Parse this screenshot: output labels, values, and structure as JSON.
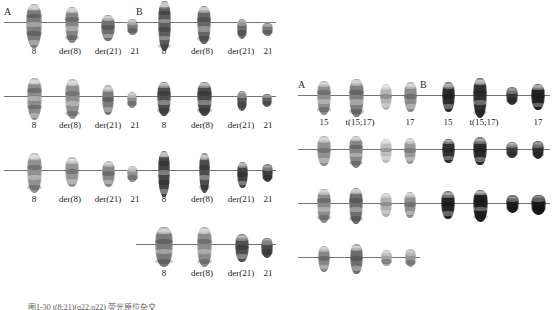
{
  "figure": {
    "background_color": "#ffffff",
    "line_color": "#5b5b5b",
    "caption_text": "图1-30  t(8;21)(q22;q22)  荧光原位杂交"
  },
  "left_panel": {
    "name": "t(8;21) panel",
    "column_a": {
      "letter": "A",
      "rows": [
        {
          "labels": [
            "8",
            "der(8)",
            "der(21)",
            "21"
          ],
          "chromosomes": [
            {
              "name": "chr-8",
              "width": 16,
              "height": 44,
              "tone": "#7b7b7b",
              "offset": 0
            },
            {
              "name": "chr-der8",
              "width": 14,
              "height": 36,
              "tone": "#858585",
              "offset": 0
            },
            {
              "name": "chr-der21",
              "width": 14,
              "height": 26,
              "tone": "#6f6f6f",
              "offset": 4
            },
            {
              "name": "chr-21",
              "width": 11,
              "height": 16,
              "tone": "#7d7d7d",
              "offset": 4
            }
          ]
        },
        {
          "labels": [
            "8",
            "der(8)",
            "der(21)",
            "21"
          ],
          "chromosomes": [
            {
              "name": "chr-8",
              "width": 15,
              "height": 42,
              "tone": "#8a8a8a",
              "offset": 0
            },
            {
              "name": "chr-der8",
              "width": 15,
              "height": 40,
              "tone": "#8f8f8f",
              "offset": 0
            },
            {
              "name": "chr-der21",
              "width": 12,
              "height": 30,
              "tone": "#7a7a7a",
              "offset": 2
            },
            {
              "name": "chr-21",
              "width": 10,
              "height": 16,
              "tone": "#8c8c8c",
              "offset": 3
            }
          ]
        },
        {
          "labels": [
            "8",
            "der(8)",
            "der(21)",
            "21"
          ],
          "chromosomes": [
            {
              "name": "chr-8",
              "width": 15,
              "height": 40,
              "tone": "#909090",
              "offset": 0
            },
            {
              "name": "chr-der8",
              "width": 14,
              "height": 30,
              "tone": "#959595",
              "offset": 0
            },
            {
              "name": "chr-der21",
              "width": 13,
              "height": 26,
              "tone": "#888888",
              "offset": 2
            },
            {
              "name": "chr-21",
              "width": 11,
              "height": 16,
              "tone": "#919191",
              "offset": 3
            }
          ]
        }
      ]
    },
    "column_b": {
      "letter": "B",
      "rows": [
        {
          "labels": [
            "8",
            "der(8)",
            "der(21)",
            "21"
          ],
          "chromosomes": [
            {
              "name": "chr-8",
              "width": 13,
              "height": 50,
              "tone": "#5c5c5c",
              "offset": 0
            },
            {
              "name": "chr-der8",
              "width": 14,
              "height": 38,
              "tone": "#656565",
              "offset": 0
            },
            {
              "name": "chr-der21",
              "width": 10,
              "height": 20,
              "tone": "#6b6b6b",
              "offset": 5
            },
            {
              "name": "chr-21",
              "width": 11,
              "height": 13,
              "tone": "#787878",
              "offset": 6
            }
          ]
        },
        {
          "labels": [
            "8",
            "der(8)",
            "der(21)",
            "21"
          ],
          "chromosomes": [
            {
              "name": "chr-8",
              "width": 14,
              "height": 34,
              "tone": "#4f4f4f",
              "offset": 0
            },
            {
              "name": "chr-der8",
              "width": 15,
              "height": 34,
              "tone": "#4a4a4a",
              "offset": 0
            },
            {
              "name": "chr-der21",
              "width": 10,
              "height": 20,
              "tone": "#585858",
              "offset": 3
            },
            {
              "name": "chr-21",
              "width": 10,
              "height": 13,
              "tone": "#5f5f5f",
              "offset": 3
            }
          ]
        },
        {
          "labels": [
            "8",
            "der(8)",
            "der(21)",
            "21"
          ],
          "chromosomes": [
            {
              "name": "chr-8",
              "width": 12,
              "height": 46,
              "tone": "#454545",
              "offset": 0
            },
            {
              "name": "chr-der8",
              "width": 11,
              "height": 40,
              "tone": "#4d4d4d",
              "offset": 0
            },
            {
              "name": "chr-der21",
              "width": 11,
              "height": 26,
              "tone": "#434343",
              "offset": 3
            },
            {
              "name": "chr-21",
              "width": 11,
              "height": 18,
              "tone": "#3f3f3f",
              "offset": 2
            }
          ]
        },
        {
          "labels": [
            "8",
            "der(8)",
            "der(21)",
            "21"
          ],
          "chromosomes": [
            {
              "name": "chr-8",
              "width": 18,
              "height": 40,
              "tone": "#7a7a7a",
              "offset": 0
            },
            {
              "name": "chr-der8",
              "width": 15,
              "height": 40,
              "tone": "#8a8a8a",
              "offset": 0
            },
            {
              "name": "chr-der21",
              "width": 14,
              "height": 28,
              "tone": "#4e4e4e",
              "offset": 2
            },
            {
              "name": "chr-21",
              "width": 12,
              "height": 20,
              "tone": "#4b4b4b",
              "offset": 2
            }
          ]
        }
      ]
    }
  },
  "right_panel": {
    "name": "t(15;17) panel",
    "column_a": {
      "letter": "A",
      "rows": [
        {
          "labels": [
            "15",
            "t(15;17)",
            "17"
          ],
          "chromosomes": [
            {
              "name": "chr-15",
              "width": 14,
              "height": 34,
              "tone": "#8d8d8d",
              "offset": 0
            },
            {
              "name": "chr-t1517",
              "width": 15,
              "height": 38,
              "tone": "#7e7e7e",
              "offset": 0
            },
            {
              "name": "chr-t1517-b",
              "width": 12,
              "height": 26,
              "tone": "#b4b4b4",
              "offset": 0
            },
            {
              "name": "chr-17",
              "width": 13,
              "height": 30,
              "tone": "#8b8b8b",
              "offset": 0
            }
          ]
        },
        {
          "labels": [],
          "chromosomes": [
            {
              "name": "chr-15",
              "width": 14,
              "height": 30,
              "tone": "#909090",
              "offset": 0
            },
            {
              "name": "chr-t1517",
              "width": 14,
              "height": 32,
              "tone": "#848484",
              "offset": 0
            },
            {
              "name": "chr-t1517-b",
              "width": 12,
              "height": 24,
              "tone": "#bdbdbd",
              "offset": 0
            },
            {
              "name": "chr-17",
              "width": 12,
              "height": 26,
              "tone": "#9a9a9a",
              "offset": 0
            }
          ]
        },
        {
          "labels": [],
          "chromosomes": [
            {
              "name": "chr-15",
              "width": 14,
              "height": 34,
              "tone": "#8a8a8a",
              "offset": 0
            },
            {
              "name": "chr-t1517",
              "width": 14,
              "height": 36,
              "tone": "#6e6e6e",
              "offset": 0
            },
            {
              "name": "chr-t1517-b",
              "width": 12,
              "height": 24,
              "tone": "#b0b0b0",
              "offset": 0
            },
            {
              "name": "chr-17",
              "width": 12,
              "height": 26,
              "tone": "#8f8f8f",
              "offset": 0
            }
          ]
        },
        {
          "labels": [],
          "chromosomes": [
            {
              "name": "chr-15",
              "width": 12,
              "height": 26,
              "tone": "#878787",
              "offset": 0
            },
            {
              "name": "chr-t1517",
              "width": 13,
              "height": 30,
              "tone": "#6d6d6d",
              "offset": 0
            },
            {
              "name": "chr-t1517-b",
              "width": 11,
              "height": 16,
              "tone": "#a3a3a3",
              "offset": 0
            },
            {
              "name": "chr-17",
              "width": 11,
              "height": 18,
              "tone": "#959595",
              "offset": 0
            }
          ]
        }
      ]
    },
    "column_b": {
      "letter": "B",
      "rows": [
        {
          "labels": [
            "15",
            "t(15;17)",
            "17"
          ],
          "chromosomes": [
            {
              "name": "chr-15",
              "width": 13,
              "height": 30,
              "tone": "#2b2b2b",
              "offset": 0
            },
            {
              "name": "chr-t1517",
              "width": 14,
              "height": 40,
              "tone": "#2f2f2f",
              "offset": 0
            },
            {
              "name": "chr-t1517-b",
              "width": 12,
              "height": 18,
              "tone": "#353535",
              "offset": 0
            },
            {
              "name": "chr-17",
              "width": 14,
              "height": 26,
              "tone": "#222222",
              "offset": 0
            }
          ]
        },
        {
          "labels": [],
          "chromosomes": [
            {
              "name": "chr-15",
              "width": 13,
              "height": 24,
              "tone": "#303030",
              "offset": 0
            },
            {
              "name": "chr-t1517",
              "width": 14,
              "height": 28,
              "tone": "#2a2a2a",
              "offset": 0
            },
            {
              "name": "chr-t1517-b",
              "width": 12,
              "height": 16,
              "tone": "#3a3a3a",
              "offset": 0
            },
            {
              "name": "chr-17",
              "width": 12,
              "height": 18,
              "tone": "#2d2d2d",
              "offset": 0
            }
          ]
        },
        {
          "labels": [],
          "chromosomes": [
            {
              "name": "chr-15",
              "width": 14,
              "height": 28,
              "tone": "#242424",
              "offset": 0
            },
            {
              "name": "chr-t1517",
              "width": 15,
              "height": 32,
              "tone": "#1f1f1f",
              "offset": 0
            },
            {
              "name": "chr-t1517-b",
              "width": 13,
              "height": 18,
              "tone": "#1b1b1b",
              "offset": 0
            },
            {
              "name": "chr-17",
              "width": 15,
              "height": 20,
              "tone": "#171717",
              "offset": 0
            }
          ]
        }
      ]
    }
  }
}
